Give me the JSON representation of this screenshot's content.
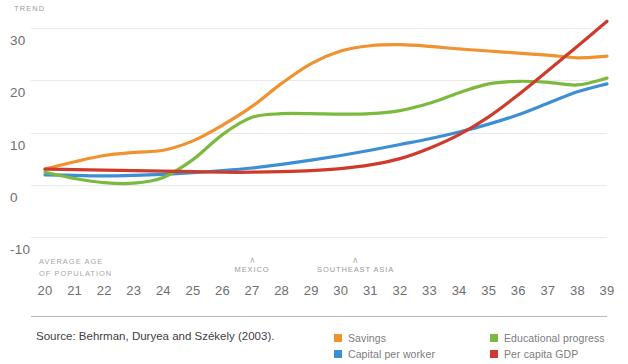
{
  "chart_data": {
    "type": "line",
    "title": "",
    "ylabel": "TREND",
    "xlabel": "AVERAGE AGE OF POPULATION",
    "xlabel_line1": "AVERAGE AGE",
    "xlabel_line2": "OF POPULATION",
    "grid": true,
    "legend_position": "bottom-right",
    "xlim": [
      20,
      39
    ],
    "ylim": [
      -12,
      33
    ],
    "yticks": [
      30,
      20,
      10,
      0,
      -10
    ],
    "xticks": [
      20,
      21,
      22,
      23,
      24,
      25,
      26,
      27,
      28,
      29,
      30,
      31,
      32,
      33,
      34,
      35,
      36,
      37,
      38,
      39
    ],
    "annotations": [
      {
        "label": "MEXICO",
        "x": 27
      },
      {
        "label": "SOUTHEAST ASIA",
        "x": 30.5
      }
    ],
    "x": [
      20,
      21,
      22,
      23,
      24,
      25,
      26,
      27,
      28,
      29,
      30,
      31,
      32,
      33,
      34,
      35,
      36,
      37,
      38,
      39
    ],
    "series": [
      {
        "name": "Savings",
        "color": "#F0922F",
        "values": [
          3.0,
          4.4,
          5.6,
          6.2,
          6.6,
          8.4,
          11.4,
          15.0,
          19.4,
          23.2,
          25.6,
          26.6,
          26.8,
          26.5,
          26.0,
          25.6,
          25.2,
          24.8,
          24.3,
          24.6
        ]
      },
      {
        "name": "Capital per worker",
        "color": "#3C8FD4",
        "values": [
          1.9,
          1.8,
          1.7,
          1.8,
          2.0,
          2.3,
          2.7,
          3.2,
          3.9,
          4.7,
          5.6,
          6.6,
          7.7,
          8.8,
          10.1,
          11.6,
          13.4,
          15.6,
          17.8,
          19.3
        ]
      },
      {
        "name": "Educational progress",
        "color": "#7DB93E",
        "values": [
          2.4,
          1.2,
          0.4,
          0.3,
          1.4,
          4.8,
          9.6,
          12.9,
          13.6,
          13.6,
          13.5,
          13.6,
          14.2,
          15.6,
          17.6,
          19.3,
          19.8,
          19.6,
          19.1,
          20.4
        ]
      },
      {
        "name": "Per capita GDP",
        "color": "#CE3B2D",
        "values": [
          3.0,
          2.9,
          2.8,
          2.7,
          2.6,
          2.5,
          2.4,
          2.4,
          2.5,
          2.7,
          3.1,
          3.8,
          5.0,
          7.0,
          9.6,
          13.0,
          17.2,
          21.8,
          26.5,
          31.3
        ]
      }
    ]
  },
  "axis": {
    "y_title": "TREND",
    "y_labels": [
      "30",
      "20",
      "10",
      "0",
      "-10"
    ],
    "x_labels": [
      "20",
      "21",
      "22",
      "23",
      "24",
      "25",
      "26",
      "27",
      "28",
      "29",
      "30",
      "31",
      "32",
      "33",
      "34",
      "35",
      "36",
      "37",
      "38",
      "39"
    ],
    "x_caption_line1": "AVERAGE AGE",
    "x_caption_line2": "OF POPULATION",
    "markers": [
      {
        "caret": "∧",
        "label": "MEXICO"
      },
      {
        "caret": "∧",
        "label": "SOUTHEAST ASIA"
      }
    ]
  },
  "footer": {
    "source": "Source: Behrman, Duryea and Székely (2003).",
    "legend": [
      {
        "label": "Savings",
        "color": "#F0922F"
      },
      {
        "label": "Capital per worker",
        "color": "#3C8FD4"
      },
      {
        "label": "Educational progress",
        "color": "#7DB93E"
      },
      {
        "label": "Per capita GDP",
        "color": "#CE3B2D"
      }
    ]
  }
}
